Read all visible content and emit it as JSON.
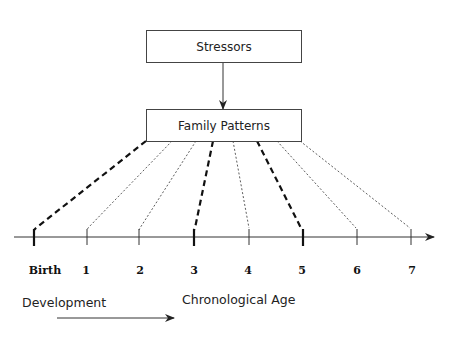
{
  "boxes": {
    "top": {
      "label": "Stressors"
    },
    "middle": {
      "label": "Family Patterns"
    }
  },
  "axis": {
    "ticks": [
      {
        "label": "Birth",
        "x": 34,
        "thick": true
      },
      {
        "label": "1",
        "x": 87,
        "thick": false
      },
      {
        "label": "2",
        "x": 139,
        "thick": false
      },
      {
        "label": "3",
        "x": 194,
        "thick": true
      },
      {
        "label": "4",
        "x": 249,
        "thick": false
      },
      {
        "label": "5",
        "x": 303,
        "thick": true
      },
      {
        "label": "6",
        "x": 357,
        "thick": false
      },
      {
        "label": "7",
        "x": 411,
        "thick": false
      }
    ]
  },
  "captions": {
    "development": "Development",
    "chronological_age": "Chronological Age"
  }
}
